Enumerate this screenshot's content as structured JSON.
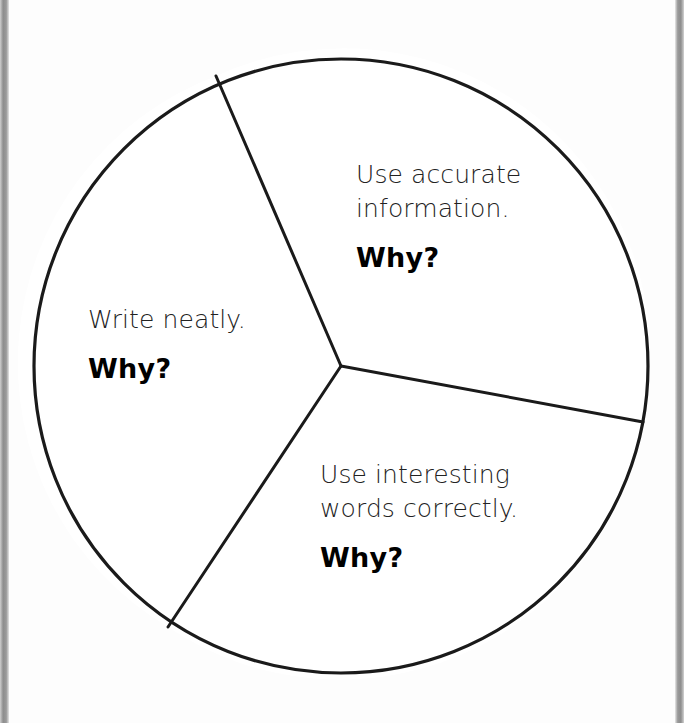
{
  "page": {
    "background_color": "#ffffff",
    "paper_color": "#fdfdfd",
    "edge_bar_color": "#8d8d8d",
    "ink_color": "#1a1a1a"
  },
  "diagram": {
    "type": "pie-wheel",
    "shape_name": "circle-divided-into-three-sectors",
    "stroke_color": "#1a1a1a",
    "stroke_width": 3,
    "fill_color": "#ffffff",
    "center": {
      "x": 341,
      "y": 366
    },
    "radius": 307,
    "divider_endpoints": [
      {
        "name": "upper-left-radius",
        "x": 216,
        "y": 76
      },
      {
        "name": "right-radius",
        "x": 643,
        "y": 422
      },
      {
        "name": "lower-left-radius",
        "x": 168,
        "y": 627
      }
    ],
    "sectors": [
      {
        "id": "accurate-information",
        "statement": "Use accurate\ninformation.",
        "prompt": "Why?"
      },
      {
        "id": "write-neatly",
        "statement": "Write neatly.",
        "prompt": "Why?"
      },
      {
        "id": "interesting-words",
        "statement": "Use interesting\nwords correctly.",
        "prompt": "Why?"
      }
    ]
  }
}
